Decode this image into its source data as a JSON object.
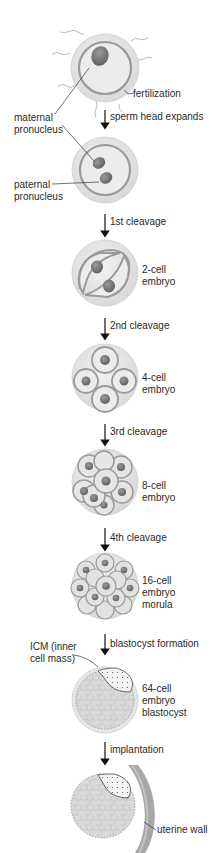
{
  "stages": [
    {
      "id": "zygote",
      "label": "",
      "pointer_labels": [
        "fertilization"
      ]
    },
    {
      "id": "pronuclear",
      "label": ""
    },
    {
      "id": "2-cell",
      "label_lines": [
        "2-cell",
        "embryo"
      ]
    },
    {
      "id": "4-cell",
      "label_lines": [
        "4-cell",
        "embryo"
      ]
    },
    {
      "id": "8-cell",
      "label_lines": [
        "8-cell",
        "embryo"
      ]
    },
    {
      "id": "16-cell",
      "label_lines": [
        "16-cell",
        "embryo",
        "morula"
      ]
    },
    {
      "id": "64-cell",
      "label_lines": [
        "64-cell",
        "embryo",
        "blastocyst"
      ]
    },
    {
      "id": "implanted",
      "label": ""
    }
  ],
  "steps": [
    {
      "label": "sperm head expands"
    },
    {
      "label": "1st cleavage"
    },
    {
      "label": "2nd cleavage"
    },
    {
      "label": "3rd cleavage"
    },
    {
      "label": "4th cleavage"
    },
    {
      "label": "blastocyst formation"
    },
    {
      "label": "implantation"
    }
  ],
  "callouts": {
    "fertilization": "fertilization",
    "maternal_pronucleus": [
      "maternal",
      "pronucleus"
    ],
    "paternal_pronucleus": [
      "paternal",
      "pronucleus"
    ],
    "icm": [
      "ICM (inner",
      "cell mass)"
    ],
    "uterine_wall": "uterine wall"
  },
  "colors": {
    "zona": "#e4e4e4",
    "zona_edge": "#c8c8c8",
    "cytoplasm": "#ececec",
    "membrane": "#9a9a9a",
    "nucleus": "#7d7d7d",
    "uterine_wall": "#a8a8a8",
    "arrow": "#111111"
  }
}
